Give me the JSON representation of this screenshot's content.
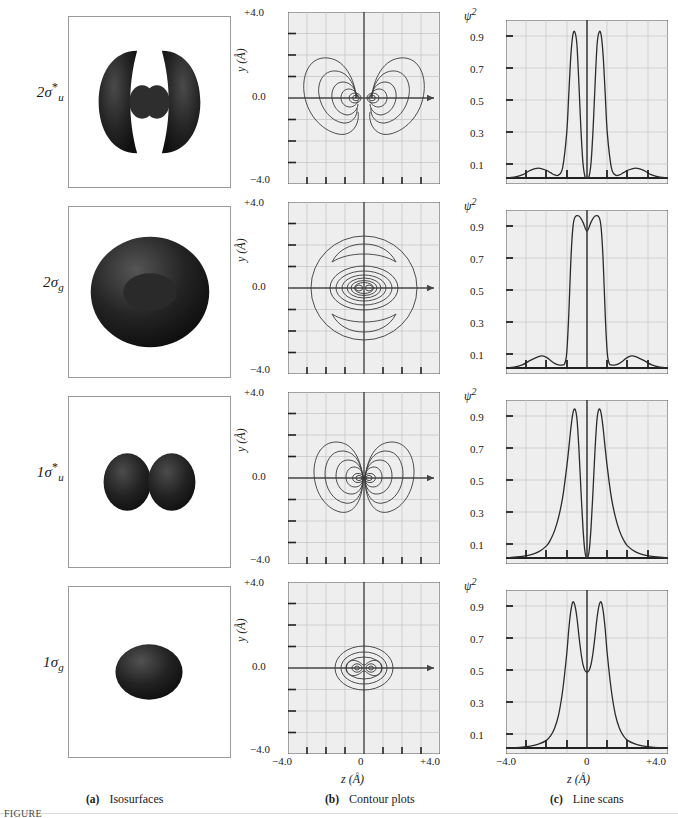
{
  "figure": {
    "columns": [
      {
        "key": "a",
        "letter": "(a)",
        "title": "Isosurfaces"
      },
      {
        "key": "b",
        "letter": "(b)",
        "title": "Contour plots"
      },
      {
        "key": "c",
        "letter": "(c)",
        "title": "Line scans"
      }
    ],
    "footnote": "FIGURE"
  },
  "rows": [
    {
      "label_main": "2σ",
      "label_sup": "*",
      "label_sub": "u",
      "orbital": "2 sigma u star"
    },
    {
      "label_main": "2σ",
      "label_sup": "",
      "label_sub": "g",
      "orbital": "2 sigma g"
    },
    {
      "label_main": "1σ",
      "label_sup": "*",
      "label_sub": "u",
      "orbital": "1 sigma u star"
    },
    {
      "label_main": "1σ",
      "label_sup": "",
      "label_sub": "g",
      "orbital": "1 sigma g"
    }
  ],
  "contour": {
    "ylabel": "y (Å)",
    "ytop": "+4.0",
    "ymid": "0.0",
    "ybot": "−4.0",
    "xlabel": "z (Å)",
    "xleft": "−4.0",
    "xmid": "0",
    "xright": "+4.0"
  },
  "linescan": {
    "ylabel": "ψ",
    "ylabel_exp": "2",
    "yticks": [
      "0.9",
      "0.7",
      "0.5",
      "0.3",
      "0.1"
    ],
    "xlabel": "z (Å)",
    "xleft": "−4.0",
    "xmid": "0",
    "xright": "+4.0"
  },
  "chart_data": [
    {
      "type": "line",
      "title": "2σu* line scan",
      "xlabel": "z (Å)",
      "ylabel": "ψ²",
      "xlim": [
        -4.0,
        4.0
      ],
      "ylim": [
        0.0,
        1.0
      ],
      "xticks": [
        -4.0,
        -3.0,
        -2.0,
        -1.0,
        0.0,
        1.0,
        2.0,
        3.0,
        4.0
      ],
      "yticks": [
        0.1,
        0.3,
        0.5,
        0.7,
        0.9
      ],
      "grid": true,
      "x": [
        -4.0,
        -3.6,
        -3.2,
        -2.8,
        -2.4,
        -2.0,
        -1.8,
        -1.6,
        -1.4,
        -1.2,
        -1.0,
        -0.9,
        -0.8,
        -0.7,
        -0.6,
        -0.5,
        -0.4,
        -0.3,
        -0.2,
        -0.1,
        0.0,
        0.1,
        0.2,
        0.3,
        0.4,
        0.5,
        0.6,
        0.7,
        0.8,
        0.9,
        1.0,
        1.2,
        1.4,
        1.6,
        1.8,
        2.0,
        2.4,
        2.8,
        3.2,
        3.6,
        4.0
      ],
      "y": [
        0.0,
        0.005,
        0.02,
        0.05,
        0.065,
        0.05,
        0.035,
        0.02,
        0.02,
        0.07,
        0.3,
        0.55,
        0.8,
        0.94,
        0.96,
        0.88,
        0.62,
        0.32,
        0.1,
        0.01,
        0.0,
        0.01,
        0.1,
        0.32,
        0.62,
        0.88,
        0.96,
        0.94,
        0.8,
        0.55,
        0.3,
        0.07,
        0.02,
        0.02,
        0.035,
        0.05,
        0.065,
        0.05,
        0.02,
        0.005,
        0.0
      ]
    },
    {
      "type": "line",
      "title": "2σg line scan",
      "xlabel": "z (Å)",
      "ylabel": "ψ²",
      "xlim": [
        -4.0,
        4.0
      ],
      "ylim": [
        0.0,
        1.0
      ],
      "xticks": [
        -4.0,
        -3.0,
        -2.0,
        -1.0,
        0.0,
        1.0,
        2.0,
        3.0,
        4.0
      ],
      "yticks": [
        0.1,
        0.3,
        0.5,
        0.7,
        0.9
      ],
      "grid": true,
      "x": [
        -4.0,
        -3.6,
        -3.2,
        -2.8,
        -2.4,
        -2.2,
        -2.0,
        -1.8,
        -1.6,
        -1.4,
        -1.2,
        -1.1,
        -1.0,
        -0.9,
        -0.8,
        -0.7,
        -0.6,
        -0.4,
        -0.2,
        0.0,
        0.2,
        0.4,
        0.6,
        0.7,
        0.8,
        0.9,
        1.0,
        1.1,
        1.2,
        1.4,
        1.6,
        1.8,
        2.0,
        2.2,
        2.4,
        2.8,
        3.2,
        3.6,
        4.0
      ],
      "y": [
        0.0,
        0.005,
        0.02,
        0.05,
        0.075,
        0.08,
        0.07,
        0.05,
        0.03,
        0.02,
        0.02,
        0.03,
        0.1,
        0.35,
        0.7,
        0.92,
        0.99,
        1.0,
        0.96,
        0.9,
        0.96,
        1.0,
        0.99,
        0.92,
        0.7,
        0.35,
        0.1,
        0.03,
        0.02,
        0.02,
        0.03,
        0.05,
        0.07,
        0.08,
        0.075,
        0.05,
        0.02,
        0.005,
        0.0
      ]
    },
    {
      "type": "line",
      "title": "1σu* line scan",
      "xlabel": "z (Å)",
      "ylabel": "ψ²",
      "xlim": [
        -4.0,
        4.0
      ],
      "ylim": [
        0.0,
        1.0
      ],
      "xticks": [
        -4.0,
        -3.0,
        -2.0,
        -1.0,
        0.0,
        1.0,
        2.0,
        3.0,
        4.0
      ],
      "yticks": [
        0.1,
        0.3,
        0.5,
        0.7,
        0.9
      ],
      "grid": true,
      "x": [
        -4.0,
        -3.6,
        -3.2,
        -2.8,
        -2.4,
        -2.0,
        -1.8,
        -1.6,
        -1.4,
        -1.2,
        -1.0,
        -0.9,
        -0.8,
        -0.7,
        -0.6,
        -0.5,
        -0.4,
        -0.3,
        -0.2,
        -0.1,
        0.0,
        0.1,
        0.2,
        0.3,
        0.4,
        0.5,
        0.6,
        0.7,
        0.8,
        0.9,
        1.0,
        1.2,
        1.4,
        1.6,
        1.8,
        2.0,
        2.4,
        2.8,
        3.2,
        3.6,
        4.0
      ],
      "y": [
        0.0,
        0.005,
        0.01,
        0.02,
        0.04,
        0.08,
        0.12,
        0.18,
        0.27,
        0.4,
        0.6,
        0.72,
        0.85,
        0.95,
        0.98,
        0.92,
        0.72,
        0.45,
        0.2,
        0.04,
        0.0,
        0.04,
        0.2,
        0.45,
        0.72,
        0.92,
        0.98,
        0.95,
        0.85,
        0.72,
        0.6,
        0.4,
        0.27,
        0.18,
        0.12,
        0.08,
        0.04,
        0.02,
        0.01,
        0.005,
        0.0
      ]
    },
    {
      "type": "line",
      "title": "1σg line scan",
      "xlabel": "z (Å)",
      "ylabel": "ψ²",
      "xlim": [
        -4.0,
        4.0
      ],
      "ylim": [
        0.0,
        1.0
      ],
      "xticks": [
        -4.0,
        -3.0,
        -2.0,
        -1.0,
        0.0,
        1.0,
        2.0,
        3.0,
        4.0
      ],
      "yticks": [
        0.1,
        0.3,
        0.5,
        0.7,
        0.9
      ],
      "grid": true,
      "x": [
        -4.0,
        -3.6,
        -3.2,
        -2.8,
        -2.4,
        -2.0,
        -1.8,
        -1.6,
        -1.4,
        -1.2,
        -1.0,
        -0.9,
        -0.8,
        -0.7,
        -0.6,
        -0.5,
        -0.4,
        -0.3,
        -0.2,
        -0.1,
        0.0,
        0.1,
        0.2,
        0.3,
        0.4,
        0.5,
        0.6,
        0.7,
        0.8,
        0.9,
        1.0,
        1.2,
        1.4,
        1.6,
        1.8,
        2.0,
        2.4,
        2.8,
        3.2,
        3.6,
        4.0
      ],
      "y": [
        0.0,
        0.002,
        0.005,
        0.012,
        0.025,
        0.05,
        0.08,
        0.13,
        0.22,
        0.38,
        0.62,
        0.78,
        0.9,
        0.96,
        0.94,
        0.86,
        0.74,
        0.63,
        0.55,
        0.51,
        0.5,
        0.51,
        0.55,
        0.63,
        0.74,
        0.86,
        0.94,
        0.96,
        0.9,
        0.78,
        0.62,
        0.38,
        0.22,
        0.13,
        0.08,
        0.05,
        0.025,
        0.012,
        0.005,
        0.002,
        0.0
      ]
    }
  ]
}
